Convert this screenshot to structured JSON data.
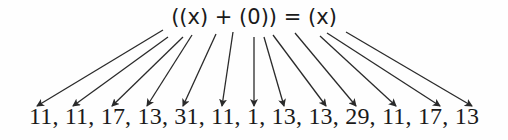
{
  "diagram": {
    "expression": "((x) + (0)) = (x)",
    "sequence_label": "11, 11, 17, 13, 31, 11, 1, 13, 13, 29, 11, 17, 13",
    "sequence": [
      11,
      11,
      17,
      13,
      31,
      11,
      1,
      13,
      13,
      29,
      11,
      17,
      13
    ],
    "arrow_color": "#2a2a2a",
    "arrows": [
      {
        "from": [
          163,
          30
        ],
        "to": [
          37,
          106
        ]
      },
      {
        "from": [
          168,
          37
        ],
        "to": [
          73,
          106
        ]
      },
      {
        "from": [
          183,
          37
        ],
        "to": [
          112,
          106
        ]
      },
      {
        "from": [
          192,
          35
        ],
        "to": [
          147,
          106
        ]
      },
      {
        "from": [
          216,
          34
        ],
        "to": [
          183,
          106
        ]
      },
      {
        "from": [
          233,
          32
        ],
        "to": [
          222,
          106
        ]
      },
      {
        "from": [
          254,
          37
        ],
        "to": [
          254,
          106
        ]
      },
      {
        "from": [
          264,
          37
        ],
        "to": [
          284,
          106
        ]
      },
      {
        "from": [
          273,
          35
        ],
        "to": [
          326,
          106
        ]
      },
      {
        "from": [
          295,
          33
        ],
        "to": [
          356,
          106
        ]
      },
      {
        "from": [
          320,
          36
        ],
        "to": [
          396,
          106
        ]
      },
      {
        "from": [
          327,
          33
        ],
        "to": [
          440,
          106
        ]
      },
      {
        "from": [
          346,
          32
        ],
        "to": [
          472,
          106
        ]
      }
    ]
  }
}
